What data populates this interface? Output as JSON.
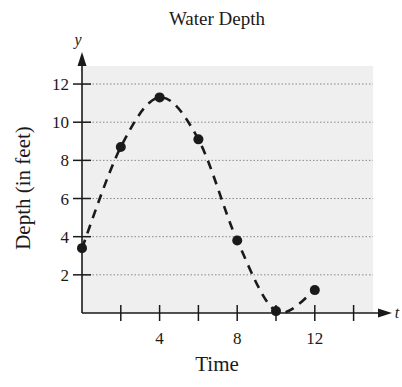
{
  "chart_data": {
    "type": "scatter",
    "title": "Water Depth",
    "xlabel": "Time",
    "ylabel": "Depth (in feet)",
    "x_axis_var": "t",
    "y_axis_var": "y",
    "xlim": [
      0,
      15
    ],
    "ylim": [
      0,
      13.5
    ],
    "x_ticks": [
      2,
      4,
      6,
      8,
      10,
      12,
      14
    ],
    "x_tick_labels": [
      "4",
      "8",
      "12"
    ],
    "x_tick_label_values": [
      4,
      8,
      12
    ],
    "y_ticks": [
      2,
      4,
      6,
      8,
      10,
      12
    ],
    "y_tick_labels": [
      "2",
      "4",
      "6",
      "8",
      "10",
      "12"
    ],
    "grid": "horizontal dotted",
    "legend": null,
    "series": [
      {
        "name": "Depth",
        "style": "points with dashed fitted curve",
        "x": [
          0,
          2,
          4,
          6,
          8,
          10,
          12
        ],
        "values": [
          3.4,
          8.7,
          11.3,
          9.1,
          3.8,
          0.1,
          1.2
        ]
      }
    ]
  },
  "colors": {
    "plot_background": "#efefef",
    "ink": "#1a1a1a",
    "grid": "#888888"
  }
}
